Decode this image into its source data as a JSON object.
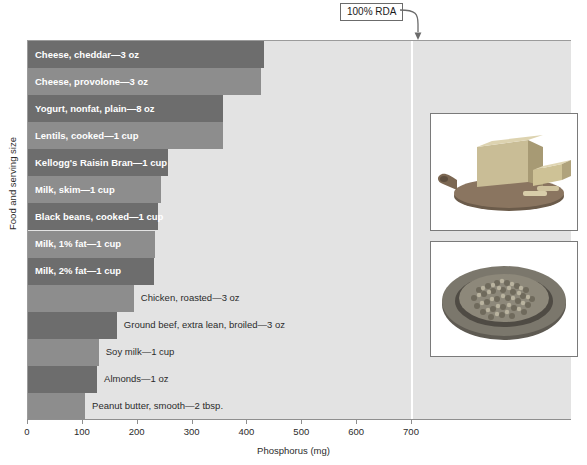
{
  "chart_data": {
    "type": "bar",
    "orientation": "horizontal",
    "title": "",
    "xlabel": "Phosphorus (mg)",
    "ylabel": "Food and serving size",
    "xlim": [
      0,
      990
    ],
    "xticks": [
      0,
      100,
      200,
      300,
      400,
      500,
      600,
      700
    ],
    "xtick_labels": [
      "0",
      "100",
      "200",
      "300",
      "400",
      "500",
      "600",
      "700"
    ],
    "grid": false,
    "legend": null,
    "categories": [
      "Cheese, cheddar—3 oz",
      "Cheese, provolone—3 oz",
      "Yogurt, nonfat, plain—8 oz",
      "Lentils, cooked—1 cup",
      "Kellogg's Raisin Bran—1 cup",
      "Milk, skim—1 cup",
      "Black beans, cooked—1 cup",
      "Milk, 1% fat—1 cup",
      "Milk, 2% fat—1 cup",
      "Chicken, roasted—3 oz",
      "Ground beef, extra lean, broiled—3 oz",
      "Soy milk—1 cup",
      "Almonds—1 oz",
      "Peanut butter, smooth—2 tbsp."
    ],
    "values": [
      430,
      425,
      355,
      355,
      255,
      242,
      237,
      232,
      230,
      193,
      162,
      129,
      126,
      104
    ],
    "label_placement": [
      "inside",
      "inside",
      "inside",
      "inside",
      "inside",
      "inside",
      "inside",
      "inside",
      "inside",
      "outside",
      "outside",
      "outside",
      "outside",
      "outside"
    ],
    "annotations": [
      {
        "name": "rda-reference",
        "text": "100% RDA",
        "x_value": 700,
        "style": "boxed-callout-with-curved-arrow"
      }
    ],
    "photos": [
      {
        "name": "cheese-photo",
        "caption": "",
        "subject": "block of cheddar cheese on a wooden cutting board"
      },
      {
        "name": "lentils-photo",
        "caption": "",
        "subject": "bowl of dry lentils"
      }
    ]
  },
  "colors": {
    "plot_background": "#e3e3e3",
    "bar_dark": "#6d6d6d",
    "bar_light": "#8d8d8d",
    "rda_line": "#ffffff",
    "axis": "#8f8f8f",
    "text": "#2b2b2b",
    "inside_label_text": "#ffffff",
    "page_background": "#ffffff"
  }
}
